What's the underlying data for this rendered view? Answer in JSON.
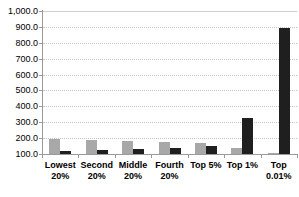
{
  "chart_data": {
    "type": "bar",
    "title": "",
    "xlabel": "",
    "ylabel": "",
    "categories": [
      "Lowest 20%",
      "Second 20%",
      "Middle 20%",
      "Fourth 20%",
      "Top 5%",
      "Top 1%",
      "Top 0.01%"
    ],
    "category_label_lines": [
      [
        "Lowest",
        "20%"
      ],
      [
        "Second",
        "20%"
      ],
      [
        "Middle",
        "20%"
      ],
      [
        "Fourth",
        "20%"
      ],
      [
        "Top 5%"
      ],
      [
        "Top 1%"
      ],
      [
        "Top",
        "0.01%"
      ]
    ],
    "series": [
      {
        "name": "gray-series",
        "color": "#a8a8a8",
        "values": [
          195,
          190,
          185,
          177,
          167,
          135,
          108
        ]
      },
      {
        "name": "black-series",
        "color": "#1f1f1f",
        "values": [
          117,
          123,
          130,
          138,
          148,
          328,
          893
        ]
      }
    ],
    "ylim": [
      100,
      1000
    ],
    "ytick_step": 100,
    "ytick_labels": [
      "1,000.0",
      "900.0",
      "800.0",
      "700.0",
      "600.0",
      "500.0",
      "400.0",
      "300.0",
      "200.0",
      "100.0"
    ],
    "grid": "horizontal-dotted",
    "legend": "none"
  },
  "colors": {
    "background": "#ffffff",
    "gridline": "#c4c4c4",
    "axis": "#9a9a9a",
    "text": "#000000"
  }
}
